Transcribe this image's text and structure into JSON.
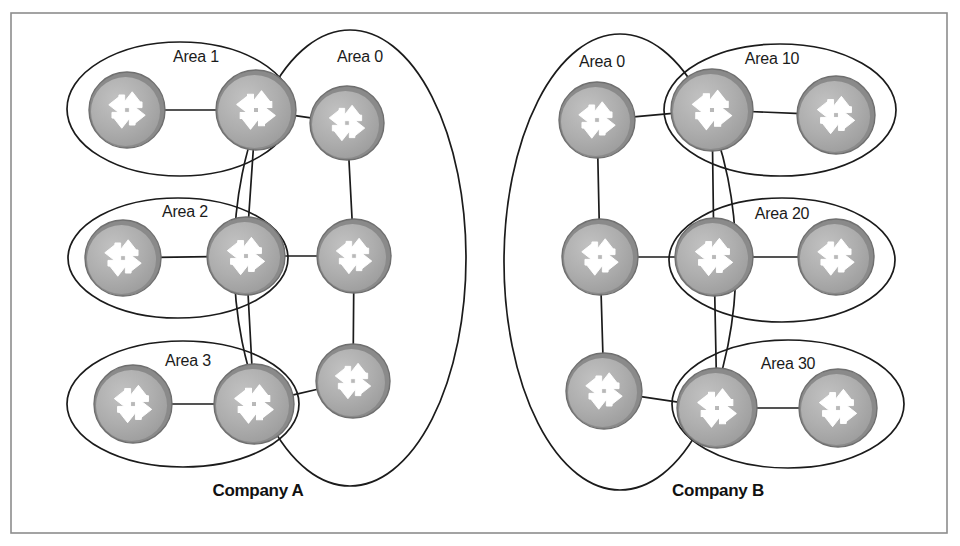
{
  "figure": {
    "frame": {
      "x": 11,
      "y": 13,
      "width": 936,
      "height": 520
    }
  },
  "colors": {
    "router_body": "#ababab",
    "router_rim": "#8a8a8a",
    "router_highlight": "#bdbdbd",
    "arrow": "#ffffff",
    "line": "#1b1b1b",
    "frame": "#8d8d8d",
    "background": "#ffffff",
    "label_text": "#1b1b1b"
  },
  "companies": [
    {
      "id": "company-a",
      "label": "Company A",
      "x": 258,
      "y": 496
    },
    {
      "id": "company-b",
      "label": "Company B",
      "x": 718,
      "y": 496
    }
  ],
  "areas": [
    {
      "id": "area-1",
      "label": "Area 1",
      "company": "Company A",
      "label_x": 196,
      "label_y": 62,
      "ellipse": {
        "cx": 180,
        "cy": 109,
        "rx": 113,
        "ry": 67,
        "rotate": 0
      }
    },
    {
      "id": "area-0-a",
      "label": "Area 0",
      "company": "Company A",
      "label_x": 360,
      "label_y": 62,
      "ellipse": {
        "cx": 350,
        "cy": 258,
        "rx": 116,
        "ry": 228,
        "rotate": 0
      }
    },
    {
      "id": "area-2",
      "label": "Area 2",
      "company": "Company A",
      "label_x": 185,
      "label_y": 217,
      "ellipse": {
        "cx": 178,
        "cy": 258,
        "rx": 110,
        "ry": 60,
        "rotate": 0
      }
    },
    {
      "id": "area-3",
      "label": "Area 3",
      "company": "Company A",
      "label_x": 188,
      "label_y": 366,
      "ellipse": {
        "cx": 183,
        "cy": 404,
        "rx": 116,
        "ry": 63,
        "rotate": 0
      }
    },
    {
      "id": "area-0-b",
      "label": "Area 0",
      "company": "Company B",
      "label_x": 602,
      "label_y": 67,
      "ellipse": {
        "cx": 620,
        "cy": 262,
        "rx": 116,
        "ry": 228,
        "rotate": 0
      }
    },
    {
      "id": "area-10",
      "label": "Area 10",
      "company": "Company B",
      "label_x": 772,
      "label_y": 64,
      "ellipse": {
        "cx": 780,
        "cy": 110,
        "rx": 116,
        "ry": 66,
        "rotate": 0
      }
    },
    {
      "id": "area-20",
      "label": "Area 20",
      "company": "Company B",
      "label_x": 782,
      "label_y": 219,
      "ellipse": {
        "cx": 782,
        "cy": 260,
        "rx": 113,
        "ry": 62,
        "rotate": 0
      }
    },
    {
      "id": "area-30",
      "label": "Area 30",
      "company": "Company B",
      "label_x": 788,
      "label_y": 369,
      "ellipse": {
        "cx": 788,
        "cy": 404,
        "rx": 116,
        "ry": 64,
        "rotate": 0
      }
    }
  ],
  "routers": [
    {
      "id": "a-r1",
      "company": "Company A",
      "area": "Area 1",
      "role": "internal",
      "cx": 127,
      "cy": 110,
      "r": 38
    },
    {
      "id": "a-r2",
      "company": "Company A",
      "area": "Area 1",
      "role": "abr",
      "cx": 256,
      "cy": 110,
      "r": 40
    },
    {
      "id": "a-r3",
      "company": "Company A",
      "area": "Area 0",
      "role": "backbone",
      "cx": 347,
      "cy": 123,
      "r": 37
    },
    {
      "id": "a-r4",
      "company": "Company A",
      "area": "Area 2",
      "role": "internal",
      "cx": 123,
      "cy": 258,
      "r": 38
    },
    {
      "id": "a-r5",
      "company": "Company A",
      "area": "Area 2",
      "role": "abr",
      "cx": 246,
      "cy": 256,
      "r": 39
    },
    {
      "id": "a-r6",
      "company": "Company A",
      "area": "Area 0",
      "role": "backbone",
      "cx": 354,
      "cy": 256,
      "r": 37
    },
    {
      "id": "a-r7",
      "company": "Company A",
      "area": "Area 3",
      "role": "internal",
      "cx": 133,
      "cy": 404,
      "r": 39
    },
    {
      "id": "a-r8",
      "company": "Company A",
      "area": "Area 3",
      "role": "abr",
      "cx": 254,
      "cy": 404,
      "r": 40
    },
    {
      "id": "a-r9",
      "company": "Company A",
      "area": "Area 0",
      "role": "backbone",
      "cx": 353,
      "cy": 381,
      "r": 37
    },
    {
      "id": "b-r1",
      "company": "Company B",
      "area": "Area 0",
      "role": "backbone",
      "cx": 597,
      "cy": 120,
      "r": 38
    },
    {
      "id": "b-r2",
      "company": "Company B",
      "area": "Area 10",
      "role": "abr",
      "cx": 712,
      "cy": 110,
      "r": 41
    },
    {
      "id": "b-r3",
      "company": "Company B",
      "area": "Area 10",
      "role": "internal",
      "cx": 836,
      "cy": 115,
      "r": 39
    },
    {
      "id": "b-r4",
      "company": "Company B",
      "area": "Area 0",
      "role": "backbone",
      "cx": 600,
      "cy": 257,
      "r": 38
    },
    {
      "id": "b-r5",
      "company": "Company B",
      "area": "Area 20",
      "role": "abr",
      "cx": 714,
      "cy": 257,
      "r": 39
    },
    {
      "id": "b-r6",
      "company": "Company B",
      "area": "Area 20",
      "role": "internal",
      "cx": 836,
      "cy": 257,
      "r": 38
    },
    {
      "id": "b-r7",
      "company": "Company B",
      "area": "Area 0",
      "role": "backbone",
      "cx": 604,
      "cy": 391,
      "r": 38
    },
    {
      "id": "b-r8",
      "company": "Company B",
      "area": "Area 30",
      "role": "abr",
      "cx": 717,
      "cy": 408,
      "r": 40
    },
    {
      "id": "b-r9",
      "company": "Company B",
      "area": "Area 30",
      "role": "internal",
      "cx": 838,
      "cy": 408,
      "r": 39
    }
  ],
  "links": [
    {
      "id": "a-l1",
      "from": "a-r1",
      "to": "a-r2"
    },
    {
      "id": "a-l2",
      "from": "a-r2",
      "to": "a-r3"
    },
    {
      "id": "a-l3",
      "from": "a-r2",
      "to": "a-r5"
    },
    {
      "id": "a-l4",
      "from": "a-r3",
      "to": "a-r6"
    },
    {
      "id": "a-l5",
      "from": "a-r4",
      "to": "a-r5"
    },
    {
      "id": "a-l6",
      "from": "a-r5",
      "to": "a-r6"
    },
    {
      "id": "a-l7",
      "from": "a-r5",
      "to": "a-r8"
    },
    {
      "id": "a-l8",
      "from": "a-r6",
      "to": "a-r9"
    },
    {
      "id": "a-l9",
      "from": "a-r7",
      "to": "a-r8"
    },
    {
      "id": "a-l10",
      "from": "a-r8",
      "to": "a-r9"
    },
    {
      "id": "b-l1",
      "from": "b-r1",
      "to": "b-r2"
    },
    {
      "id": "b-l2",
      "from": "b-r2",
      "to": "b-r3"
    },
    {
      "id": "b-l3",
      "from": "b-r2",
      "to": "b-r5"
    },
    {
      "id": "b-l4",
      "from": "b-r1",
      "to": "b-r4"
    },
    {
      "id": "b-l5",
      "from": "b-r4",
      "to": "b-r5"
    },
    {
      "id": "b-l6",
      "from": "b-r5",
      "to": "b-r6"
    },
    {
      "id": "b-l7",
      "from": "b-r5",
      "to": "b-r8"
    },
    {
      "id": "b-l8",
      "from": "b-r4",
      "to": "b-r7"
    },
    {
      "id": "b-l9",
      "from": "b-r7",
      "to": "b-r8"
    },
    {
      "id": "b-l10",
      "from": "b-r8",
      "to": "b-r9"
    }
  ],
  "icons": {
    "router": "router-icon",
    "router_description": "circle with four-way arrow cross"
  }
}
